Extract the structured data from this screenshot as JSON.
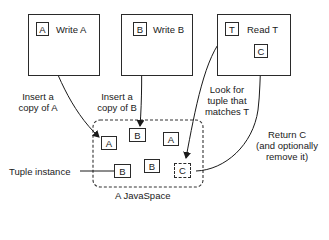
{
  "processes": [
    {
      "id": "write-a",
      "tuple": "A",
      "label": "Write A"
    },
    {
      "id": "write-b",
      "tuple": "B",
      "label": "Write B"
    },
    {
      "id": "read-t",
      "tuple": "T",
      "label": "Read T",
      "result": "C"
    }
  ],
  "annotations": {
    "insert_a": [
      "Insert a",
      "copy of A"
    ],
    "insert_b": [
      "Insert a",
      "copy of B"
    ],
    "look_for": [
      "Look for",
      "tuple that",
      "matches T"
    ],
    "return_c": [
      "Return C",
      "(and optionally",
      "remove it)"
    ],
    "tuple_instance": "Tuple instance"
  },
  "space": {
    "label": "A JavaSpace",
    "tuples": [
      "A",
      "B",
      "A",
      "B",
      "B",
      "C"
    ]
  }
}
